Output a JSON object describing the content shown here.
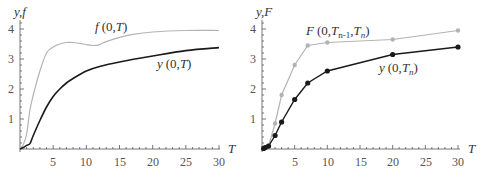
{
  "chart_data": [
    {
      "type": "line",
      "panel": "left",
      "title": "",
      "xlabel": "T",
      "ylabel": "y,f",
      "xlim": [
        0,
        30
      ],
      "ylim": [
        0,
        4.2
      ],
      "xticks": [
        5,
        10,
        15,
        20,
        25,
        30
      ],
      "yticks": [
        1,
        2,
        3,
        4
      ],
      "grid": false,
      "legend": "inline labels",
      "series": [
        {
          "name": "f(0,T)",
          "color": "#b3b3b3",
          "x": [
            0,
            0.5,
            1,
            1.5,
            2,
            3,
            4,
            5,
            6,
            7,
            8,
            9,
            10,
            11,
            12,
            13,
            15,
            17,
            20,
            25,
            30
          ],
          "values": [
            0,
            0.15,
            0.5,
            1.3,
            1.8,
            2.6,
            3.2,
            3.4,
            3.5,
            3.55,
            3.55,
            3.52,
            3.48,
            3.45,
            3.48,
            3.58,
            3.72,
            3.82,
            3.9,
            3.95,
            3.95
          ]
        },
        {
          "name": "y(0,T)",
          "color": "#1a1a1a",
          "x": [
            0,
            0.5,
            1,
            1.5,
            2,
            3,
            4,
            5,
            6,
            7,
            8,
            10,
            12,
            15,
            20,
            25,
            30
          ],
          "values": [
            0,
            0.05,
            0.12,
            0.18,
            0.45,
            0.95,
            1.4,
            1.75,
            2.0,
            2.2,
            2.35,
            2.6,
            2.75,
            2.9,
            3.1,
            3.28,
            3.38
          ]
        }
      ],
      "annotations": [
        {
          "text": "f(0,T)",
          "x": 13,
          "y": 3.95
        },
        {
          "text": "y(0,T)",
          "x": 19,
          "y": 2.6
        }
      ]
    },
    {
      "type": "line",
      "panel": "right",
      "title": "",
      "xlabel": "T",
      "ylabel": "y,F",
      "xlim": [
        0,
        30
      ],
      "ylim": [
        0,
        4.2
      ],
      "xticks": [
        5,
        10,
        15,
        20,
        25,
        30
      ],
      "yticks": [
        1,
        2,
        3,
        4
      ],
      "grid": false,
      "legend": "inline labels",
      "markers": true,
      "series": [
        {
          "name": "F(0,T_{n-1},T_n)",
          "color": "#b3b3b3",
          "x": [
            0.25,
            0.5,
            1,
            2,
            3,
            5,
            7,
            10,
            20,
            30
          ],
          "values": [
            0.02,
            0.05,
            0.1,
            0.85,
            1.8,
            2.8,
            3.45,
            3.55,
            3.65,
            3.95
          ]
        },
        {
          "name": "y(0,T_n)",
          "color": "#1a1a1a",
          "x": [
            0.25,
            0.5,
            1,
            2,
            3,
            5,
            7,
            10,
            20,
            30
          ],
          "values": [
            0.02,
            0.05,
            0.1,
            0.45,
            0.9,
            1.65,
            2.2,
            2.6,
            3.15,
            3.4
          ]
        }
      ],
      "annotations": [
        {
          "text": "F(0,T_{n-1},T_n)",
          "x": 8,
          "y": 3.85
        },
        {
          "text": "y(0,T_n)",
          "x": 19,
          "y": 2.55
        }
      ]
    }
  ],
  "left": {
    "ylabel": "y,f",
    "xlabel": "T",
    "xticks": [
      "5",
      "10",
      "15",
      "20",
      "25",
      "30"
    ],
    "yticks": [
      "1",
      "2",
      "3",
      "4"
    ],
    "label_f_fn": "f",
    "label_f_args": "(0,",
    "label_f_T": "T",
    "label_close": ")",
    "label_y_fn": "y",
    "label_y_args": "(0,",
    "label_y_T": "T"
  },
  "right": {
    "ylabel": "y,F",
    "xlabel": "T",
    "xticks": [
      "5",
      "10",
      "15",
      "20",
      "25",
      "30"
    ],
    "yticks": [
      "1",
      "2",
      "3",
      "4"
    ],
    "label_F_fn": "F",
    "label_F_args": "(0,",
    "label_F_T1": "T",
    "label_F_sub1": "n-1",
    "label_F_comma": ",",
    "label_F_T2": "T",
    "label_F_sub2": "n",
    "label_close": ")",
    "label_y_fn": "y",
    "label_y_args": "(0,",
    "label_y_T": "T",
    "label_y_sub": "n"
  },
  "colors": {
    "light": "#b3b3b3",
    "dark": "#1a1a1a",
    "axis": "#555555"
  }
}
